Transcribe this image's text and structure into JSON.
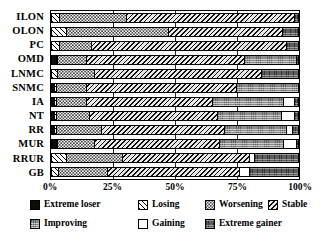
{
  "chart_data": {
    "type": "bar",
    "orientation": "horizontal",
    "stacked": true,
    "normalized_percent": true,
    "title": "",
    "xlabel": "",
    "ylabel": "",
    "xlim": [
      0,
      100
    ],
    "xticks": [
      0,
      25,
      50,
      75,
      100
    ],
    "xtick_labels": [
      "0%",
      "25%",
      "50%",
      "75%",
      "100%"
    ],
    "grid": true,
    "legend_position": "bottom",
    "categories": [
      "ILON",
      "OLON",
      "PC",
      "OMD",
      "LNMC",
      "SNMC",
      "IA",
      "NT",
      "RR",
      "MUR",
      "RRUR",
      "GB"
    ],
    "series": [
      {
        "name": "Extreme loser",
        "pattern": "solid-black",
        "values": [
          0.0,
          0.0,
          0.0,
          1.5,
          0.0,
          1.0,
          1.0,
          1.0,
          1.0,
          1.5,
          0.0,
          0.0
        ]
      },
      {
        "name": "Losing",
        "pattern": "diagonal-hatch",
        "values": [
          3.0,
          5.5,
          3.0,
          0.5,
          2.0,
          0.5,
          0.5,
          0.5,
          0.5,
          0.5,
          5.5,
          2.5
        ]
      },
      {
        "name": "Worsening",
        "pattern": "light-dotted",
        "values": [
          27.0,
          41.5,
          13.0,
          12.0,
          15.0,
          12.5,
          12.5,
          13.5,
          18.5,
          15.0,
          23.0,
          20.0
        ]
      },
      {
        "name": "Stable",
        "pattern": "backslash-hatch",
        "values": [
          68.5,
          46.5,
          79.0,
          64.0,
          68.0,
          61.0,
          51.0,
          52.0,
          50.0,
          51.0,
          51.5,
          53.5
        ]
      },
      {
        "name": "Improving",
        "pattern": "gray-texture",
        "values": [
          0.0,
          0.0,
          0.0,
          21.0,
          0.0,
          25.0,
          29.0,
          26.0,
          25.0,
          26.0,
          0.0,
          0.0
        ]
      },
      {
        "name": "Gaining",
        "pattern": "white",
        "values": [
          0.0,
          0.0,
          0.0,
          0.0,
          0.0,
          0.0,
          4.5,
          5.5,
          2.5,
          5.0,
          2.0,
          4.0
        ]
      },
      {
        "name": "Extreme gainer",
        "pattern": "dark-gray",
        "values": [
          1.5,
          6.5,
          5.0,
          1.0,
          15.0,
          0.0,
          1.5,
          1.5,
          2.5,
          1.0,
          18.0,
          20.0
        ]
      }
    ]
  },
  "legend": {
    "items": [
      {
        "label": "Extreme loser",
        "icon": "swatch-solid-black-icon"
      },
      {
        "label": "Losing",
        "icon": "swatch-diagonal-hatch-icon"
      },
      {
        "label": "Worsening",
        "icon": "swatch-light-dotted-icon"
      },
      {
        "label": "Stable",
        "icon": "swatch-backslash-hatch-icon"
      },
      {
        "label": "Improving",
        "icon": "swatch-gray-texture-icon"
      },
      {
        "label": "Gaining",
        "icon": "swatch-white-icon"
      },
      {
        "label": "Extreme gainer",
        "icon": "swatch-dark-gray-icon"
      }
    ]
  }
}
